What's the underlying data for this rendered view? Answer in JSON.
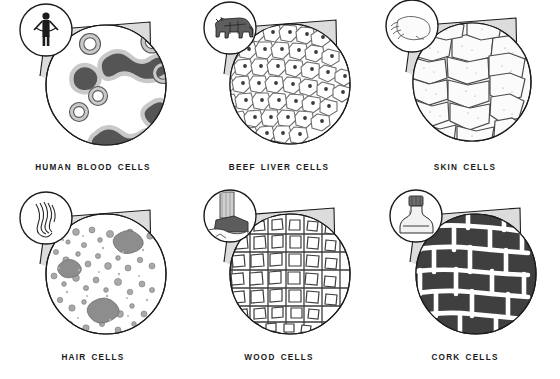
{
  "plate": {
    "title": "Cells as seen under the microscope",
    "background_color": "#ffffff",
    "ink_color": "#1b1b1b",
    "cone_fill": "#dcdcdc",
    "columns": 3,
    "rows": 2
  },
  "panels": [
    {
      "id": "human-blood-cells",
      "caption": "HUMAN BLOOD CELLS",
      "caption_words": [
        "HUMAN",
        "BLOOD",
        "CELLS"
      ],
      "source_icon": "standing-human-figure-icon",
      "source_label": "human",
      "cell_pattern": "blood-cells",
      "pattern_description": "scattered rounded dark cells with pale rings on white field",
      "cell_fill": "#555555",
      "cell_ring": "#c9c9c9",
      "field_fill": "#ffffff"
    },
    {
      "id": "beef-liver-cells",
      "caption": "BEEF LIVER CELLS",
      "caption_words": [
        "BEEF",
        "LIVER",
        "CELLS"
      ],
      "source_icon": "cow-icon",
      "source_label": "beef",
      "cell_pattern": "liver-cells",
      "pattern_description": "dense packed polygonal cells each with a dark central nucleus",
      "cell_fill": "#ffffff",
      "cell_ring": "#6d6d6d",
      "field_fill": "#ffffff"
    },
    {
      "id": "skin-cells",
      "caption": "SKIN CELLS",
      "caption_words": [
        "SKIN",
        "CELLS"
      ],
      "source_icon": "hand-icon",
      "source_label": "skin",
      "cell_pattern": "skin-cells",
      "pattern_description": "large flat irregular polygon cells with stippled texture",
      "cell_fill": "#fbfbfb",
      "cell_ring": "#4a4a4a",
      "field_fill": "#ffffff"
    },
    {
      "id": "hair-cells",
      "caption": "HAIR CELLS",
      "caption_words": [
        "HAIR",
        "CELLS"
      ],
      "source_icon": "hair-lock-icon",
      "source_label": "hair",
      "cell_pattern": "hair-cells",
      "pattern_description": "fine granular mottled speckled texture",
      "cell_fill": "#9a9a9a",
      "cell_ring": "#777777",
      "field_fill": "#ffffff"
    },
    {
      "id": "wood-cells",
      "caption": "WOOD CELLS",
      "caption_words": [
        "WOOD",
        "CELLS"
      ],
      "source_icon": "tree-trunk-icon",
      "source_label": "wood",
      "cell_pattern": "wood-cells",
      "pattern_description": "grid of thick walled rectangular boxes in columns",
      "cell_fill": "#ffffff",
      "cell_ring": "#3d3d3d",
      "field_fill": "#ffffff"
    },
    {
      "id": "cork-cells",
      "caption": "CORK CELLS",
      "caption_words": [
        "CORK",
        "CELLS"
      ],
      "source_icon": "corked-bottle-icon",
      "source_label": "cork",
      "cell_pattern": "cork-cells",
      "pattern_description": "dark brick-like blocks separated by thick white walls",
      "cell_fill": "#3f3f3f",
      "cell_ring": "#ffffff",
      "field_fill": "#3f3f3f"
    }
  ]
}
